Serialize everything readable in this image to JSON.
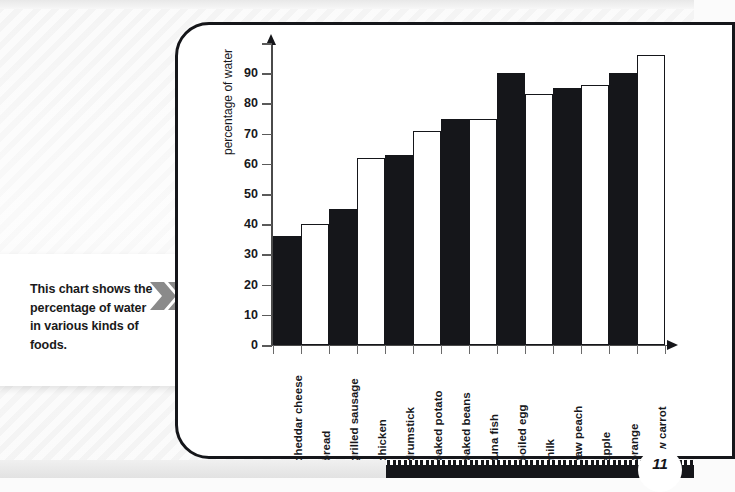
{
  "caption": {
    "text": "This chart shows the percentage of water in various kinds of foods.",
    "chevron_icon": "double-chevron-right-icon",
    "chevron_color": "#8a8a8a"
  },
  "page": {
    "number": "11"
  },
  "chart_data": {
    "type": "bar",
    "title": "",
    "xlabel": "",
    "ylabel": "percentage of water",
    "ylim": [
      0,
      100
    ],
    "ytick_labels": [
      "0",
      "10",
      "20",
      "30",
      "40",
      "50",
      "60",
      "70",
      "80",
      "90"
    ],
    "ytick_values": [
      0,
      10,
      20,
      30,
      40,
      50,
      60,
      70,
      80,
      90
    ],
    "unlabeled_tick_values": [
      100
    ],
    "grid": false,
    "legend": "none",
    "bar_fill_pattern": "alternating black and white",
    "categories": [
      "cheddar cheese",
      "bread",
      "grilled sausage",
      "chicken",
      "drumstick",
      "baked potato",
      "baked beans",
      "tuna fish",
      "boiled egg",
      "milk",
      "raw peach",
      "apple",
      "orange",
      "raw carrot"
    ],
    "values": [
      36,
      40,
      45,
      62,
      63,
      71,
      75,
      75,
      90,
      83,
      85,
      86,
      90,
      96
    ],
    "bar_colors": [
      "#15161a",
      "#ffffff",
      "#15161a",
      "#ffffff",
      "#15161a",
      "#ffffff",
      "#15161a",
      "#ffffff",
      "#15161a",
      "#ffffff",
      "#15161a",
      "#ffffff",
      "#15161a",
      "#ffffff"
    ]
  },
  "colors": {
    "ink": "#15161a",
    "panel_background": "#ffffff",
    "page_background": "#f4f4f4"
  }
}
